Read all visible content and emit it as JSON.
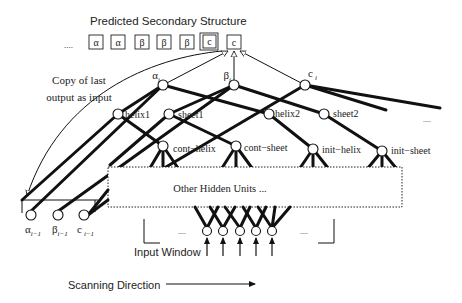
{
  "title": "Predicted Secondary Structure",
  "sequence": {
    "leading_ellipsis": "....",
    "items": [
      "α",
      "α",
      "β",
      "β",
      "β",
      "c",
      "c"
    ]
  },
  "output_nodes": {
    "alpha": {
      "base": "α",
      "sub": "i"
    },
    "beta": {
      "base": "β",
      "sub": "i"
    },
    "coil": {
      "base": "c",
      "sub": "i"
    }
  },
  "hidden_nodes": {
    "helix1": "helix1",
    "sheet1": "sheet1",
    "helix2": "helix2",
    "sheet2": "sheet2",
    "cont_helix": "cont−helix",
    "cont_sheet": "cont−sheet",
    "init_helix": "init−helix",
    "init_sheet": "init−sheet",
    "right_ellipsis": "...."
  },
  "hidden_box_label": "Other Hidden Units ...",
  "feedback_label": {
    "line1": "Copy of last",
    "line2": "output as input"
  },
  "previous_outputs": {
    "alpha": {
      "base": "α",
      "sub": "i−1"
    },
    "beta": {
      "base": "β",
      "sub": "i−1"
    },
    "coil": {
      "base": "c",
      "sub": "i−1"
    }
  },
  "input_window": {
    "label": "Input Window",
    "left_ellipsis": "....",
    "right_ellipsis": "....",
    "unit_count": 5
  },
  "scanning_direction_label": "Scanning Direction"
}
